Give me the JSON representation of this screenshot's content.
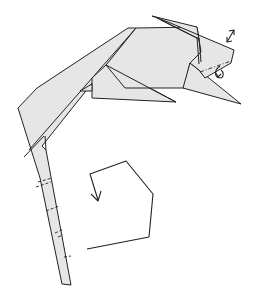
{
  "diagram": {
    "type": "origami-step",
    "colors": {
      "paper": "#e6e6e6",
      "line": "#222222",
      "background": "#ffffff"
    },
    "parts": [
      {
        "name": "head",
        "description": "head with layered flap at top right"
      },
      {
        "name": "body",
        "description": "central body section"
      },
      {
        "name": "front-leg",
        "description": "triangular leg pointing right"
      },
      {
        "name": "back-leg",
        "description": "triangular leg pointing lower right"
      },
      {
        "name": "tail",
        "description": "long tapering tail curving down with crimp marks"
      }
    ],
    "symbols": [
      {
        "name": "double-arrow-icon",
        "meaning": "open / unfold layers"
      },
      {
        "name": "mountain-fold-line",
        "meaning": "dash-dot fold line on head"
      },
      {
        "name": "fold-behind-arrow-icon",
        "meaning": "fold behind"
      },
      {
        "name": "crimp-lines",
        "meaning": "dashed crimp folds along tail"
      },
      {
        "name": "curl-arrow-icon",
        "meaning": "curl the tail into a spiral"
      }
    ]
  }
}
